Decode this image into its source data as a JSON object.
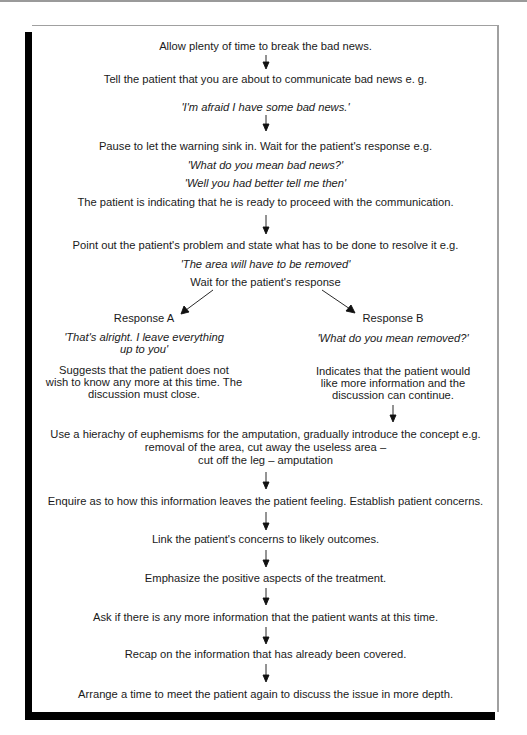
{
  "flowchart": {
    "steps": [
      {
        "text": "Allow plenty of time to break the bad news."
      },
      {
        "text": "Tell the patient that you are about to communicate bad news e. g.",
        "example": "'I'm afraid I have some bad news.'"
      },
      {
        "text": "Pause to let the warning sink in. Wait for the patient's response e.g.",
        "examples": [
          "'What do you mean bad news?'",
          "'Well you had better tell me then'"
        ],
        "note": "The patient is indicating that he is ready to proceed with the communication."
      },
      {
        "text": "Point out the patient's problem and state what has to be done to resolve it e.g.",
        "example": "'The area will have to be removed'",
        "followup": "Wait for the patient's response"
      }
    ],
    "branches": {
      "a": {
        "label": "Response A",
        "quote_lines": [
          "'That's alright. I leave everything",
          "up to you'"
        ],
        "desc_lines": [
          "Suggests that the patient does not",
          "wish to know any more at this time. The",
          "discussion must close."
        ]
      },
      "b": {
        "label": "Response B",
        "quote_lines": [
          "'What do you mean removed?'"
        ],
        "desc_lines": [
          "Indicates that the patient would",
          "like more information and the",
          "discussion can continue."
        ]
      }
    },
    "continuation": [
      {
        "lines": [
          "Use a hierachy of euphemisms for the amputation, gradually introduce the concept e.g.",
          "removal of the area, cut away the useless area –",
          "cut off the leg – amputation"
        ]
      },
      {
        "text": "Enquire as to how this information leaves the patient feeling. Establish patient concerns."
      },
      {
        "text": "Link the patient's concerns to likely outcomes."
      },
      {
        "text": "Emphasize the positive aspects of the treatment."
      },
      {
        "text": "Ask if there is any more information that the patient wants at this time."
      },
      {
        "text": "Recap on the information that has already been covered."
      },
      {
        "text": "Arrange a time to meet the patient again to discuss the issue in more depth."
      }
    ]
  },
  "colors": {
    "shadow": "#000000",
    "border": "#a0a0a0",
    "text": "#1a1a1a"
  }
}
